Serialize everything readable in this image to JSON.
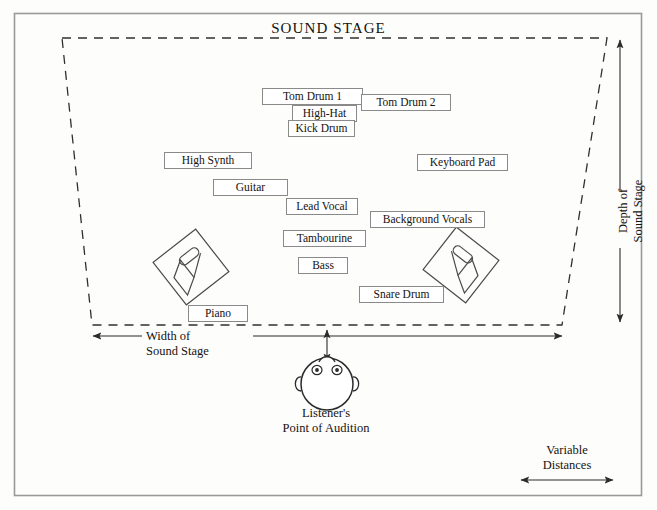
{
  "diagram": {
    "title": "SOUND STAGE",
    "background_color": "#fdfdfc",
    "line_color": "#3b3b3b",
    "box_border_color": "#8a8a8a"
  },
  "annotations": {
    "depth": "Depth of\nSound Stage",
    "depth_line1": "Depth of",
    "depth_line2": "Sound Stage",
    "width_line1": "Width of",
    "width_line2": "Sound Stage",
    "listener_line1": "Listener's",
    "listener_line2": "Point of Audition",
    "variable_line1": "Variable",
    "variable_line2": "Distances"
  },
  "instruments": [
    {
      "name": "tom-drum-1",
      "label": "Tom Drum 1",
      "x": 262,
      "y": 88,
      "w": 101
    },
    {
      "name": "tom-drum-2",
      "label": "Tom Drum 2",
      "x": 361,
      "y": 94,
      "w": 90
    },
    {
      "name": "high-hat",
      "label": "High-Hat",
      "x": 292,
      "y": 105,
      "w": 65
    },
    {
      "name": "kick-drum",
      "label": "Kick Drum",
      "x": 288,
      "y": 120,
      "w": 67
    },
    {
      "name": "high-synth",
      "label": "High Synth",
      "x": 164,
      "y": 152,
      "w": 88
    },
    {
      "name": "keyboard-pad",
      "label": "Keyboard Pad",
      "x": 417,
      "y": 154,
      "w": 91
    },
    {
      "name": "guitar",
      "label": "Guitar",
      "x": 213,
      "y": 179,
      "w": 75
    },
    {
      "name": "lead-vocal",
      "label": "Lead Vocal",
      "x": 286,
      "y": 198,
      "w": 72
    },
    {
      "name": "background-vocals",
      "label": "Background Vocals",
      "x": 370,
      "y": 211,
      "w": 115
    },
    {
      "name": "tambourine",
      "label": "Tambourine",
      "x": 283,
      "y": 230,
      "w": 83
    },
    {
      "name": "bass",
      "label": "Bass",
      "x": 298,
      "y": 257,
      "w": 50
    },
    {
      "name": "snare-drum",
      "label": "Snare Drum",
      "x": 359,
      "y": 286,
      "w": 85
    },
    {
      "name": "piano",
      "label": "Piano",
      "x": 188,
      "y": 305,
      "w": 60
    }
  ],
  "speakers": [
    {
      "name": "left-speaker",
      "cx": 191,
      "cy": 267
    },
    {
      "name": "right-speaker",
      "cx": 461,
      "cy": 265
    }
  ],
  "listener": {
    "name": "listener-head",
    "cx": 327,
    "cy": 382
  },
  "chart_data": {
    "type": "diagram",
    "title": "SOUND STAGE",
    "axes": {
      "horizontal": "Width of Sound Stage",
      "vertical": "Depth of Sound Stage",
      "listener_distance": "Variable Distances"
    },
    "elements": [
      "Tom Drum 1",
      "Tom Drum 2",
      "High-Hat",
      "Kick Drum",
      "High Synth",
      "Keyboard Pad",
      "Guitar",
      "Lead Vocal",
      "Background Vocals",
      "Tambourine",
      "Bass",
      "Snare Drum",
      "Piano"
    ]
  }
}
